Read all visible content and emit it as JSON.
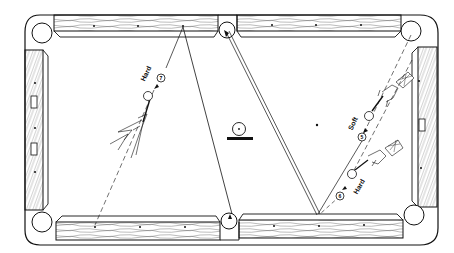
{
  "figure": {
    "type": "billiards-shot-diagram",
    "table": {
      "pockets": [
        "top-left",
        "top-middle",
        "top-right",
        "bottom-left",
        "bottom-middle",
        "bottom-right"
      ],
      "diamonds_per_rail_segment": 3
    },
    "shots": [
      {
        "ball": "7",
        "label": "Hard",
        "position": "left-center"
      },
      {
        "ball": "5",
        "label": "Soft",
        "position": "right-upper"
      },
      {
        "ball": "6",
        "label": "Hard",
        "position": "right-lower"
      }
    ],
    "labels": {
      "ball7": "7",
      "ball5": "5",
      "ball6": "6",
      "hard_left": "Hard",
      "soft_right": "Soft",
      "hard_right": "Hard"
    },
    "colors": {
      "ink": "#111111",
      "background": "#ffffff"
    }
  }
}
